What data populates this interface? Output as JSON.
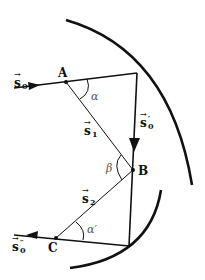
{
  "diagram": {
    "colors": {
      "stroke": "#111111",
      "angle_label": "#555555",
      "background": "#ffffff"
    },
    "points": {
      "A": {
        "label": "A"
      },
      "B": {
        "label": "B"
      },
      "C": {
        "label": "C"
      }
    },
    "vectors": {
      "s0": {
        "label": "s",
        "sub": "0",
        "prime": ""
      },
      "s0_prime": {
        "label": "s",
        "sub": "0",
        "prime": "′"
      },
      "s0_double_prime": {
        "label": "s",
        "sub": "0",
        "prime": "″"
      },
      "s1": {
        "label": "s",
        "sub": "1",
        "prime": ""
      },
      "s2": {
        "label": "s",
        "sub": "2",
        "prime": ""
      }
    },
    "angles": {
      "alpha": "α",
      "beta": "β",
      "alpha_prime": "α′"
    },
    "arrow_glyph": "→"
  }
}
